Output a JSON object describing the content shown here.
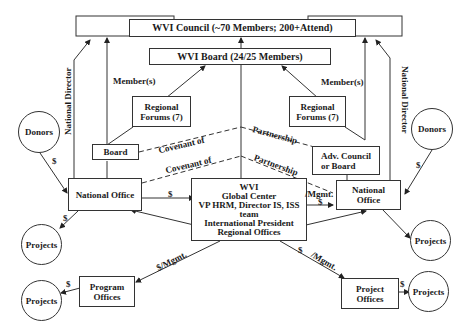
{
  "diagram": {
    "council": "WVI Council (~70 Members; 200+Attend)",
    "board": "WVI Board (24/25 Members)",
    "regional_forums_left": [
      "Regional",
      "Forums (7)"
    ],
    "regional_forums_right": [
      "Regional",
      "Forums (7)"
    ],
    "members_left": "Member(s)",
    "members_right": "Member(s)",
    "national_director_left": "National Director",
    "national_director_right": "National Director",
    "donors_left": "Donors",
    "donors_right": "Donors",
    "board_small": "Board",
    "adv_council": [
      "Adv. Council",
      "or Board"
    ],
    "covenant_upper": "Covenant of",
    "covenant_lower": "Covenant of",
    "partnership_upper": "Partnership",
    "partnership_lower": "Partnership",
    "national_office_left": "National Office",
    "national_office_right": [
      "National",
      "Office"
    ],
    "global_center": [
      "WVI",
      "Global Center",
      "VP HRM, Director IS, ISS",
      "team",
      "International President",
      "Regional Offices"
    ],
    "projects_left_upper": "Projects",
    "projects_left_lower": "Projects",
    "projects_right_upper": "Projects",
    "projects_right_lower": "Projects",
    "program_offices": [
      "Program",
      "Offices"
    ],
    "project_offices": [
      "Project",
      "Offices"
    ],
    "dollar": "$",
    "dollar_mgmt_left": "$/Mgmt.",
    "mgmt_right_top": "/Mgmt.",
    "mgmt_right_bottom": "/Mgmt."
  }
}
